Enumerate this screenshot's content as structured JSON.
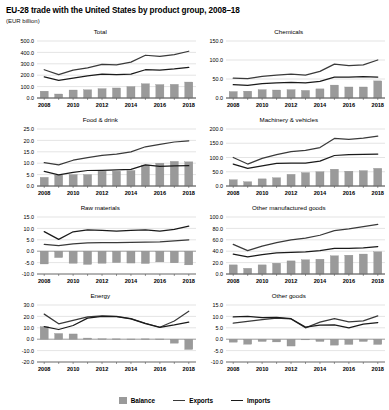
{
  "header": {
    "title": "EU-28 trade with the United States by product group, 2008–18",
    "subtitle": "(EUR billion)"
  },
  "legend": {
    "position": "bottom-center",
    "items": [
      {
        "label": "Balance",
        "marker": "bar-swatch",
        "color": "#9a9a9a"
      },
      {
        "label": "Exports",
        "marker": "line",
        "color": "#3a3a3a"
      },
      {
        "label": "Imports",
        "marker": "line",
        "color": "#1a1a1a"
      }
    ]
  },
  "chart_data": [
    {
      "type": "bar",
      "title": "Total",
      "xlabel": "",
      "ylabel": "",
      "grid": true,
      "x": [
        2008,
        2009,
        2010,
        2011,
        2012,
        2013,
        2014,
        2015,
        2016,
        2017,
        2018
      ],
      "tick_labels": [
        "2008",
        "",
        "2010",
        "",
        "2012",
        "",
        "2014",
        "",
        "2016",
        "",
        "2018"
      ],
      "ylim": [
        0,
        500
      ],
      "yticks": [
        0,
        100,
        200,
        300,
        400,
        500
      ],
      "ytick_labels": [
        "0.0",
        "100.0",
        "200.0",
        "300.0",
        "400.0",
        "500.0"
      ],
      "series": [
        {
          "name": "Balance",
          "type": "bar",
          "values": [
            60,
            35,
            70,
            72,
            82,
            88,
            100,
            125,
            118,
            120,
            140
          ]
        },
        {
          "name": "Exports",
          "type": "line",
          "values": [
            248,
            205,
            245,
            265,
            295,
            290,
            315,
            375,
            365,
            380,
            410
          ]
        },
        {
          "name": "Imports",
          "type": "line",
          "values": [
            185,
            155,
            175,
            195,
            210,
            205,
            210,
            248,
            245,
            255,
            268
          ]
        }
      ]
    },
    {
      "type": "bar",
      "title": "Chemicals",
      "xlabel": "",
      "ylabel": "",
      "grid": true,
      "x": [
        2008,
        2009,
        2010,
        2011,
        2012,
        2013,
        2014,
        2015,
        2016,
        2017,
        2018
      ],
      "tick_labels": [
        "2008",
        "",
        "2010",
        "",
        "2012",
        "",
        "2014",
        "",
        "2016",
        "",
        "2018"
      ],
      "ylim": [
        0,
        150
      ],
      "yticks": [
        0,
        50,
        100,
        150
      ],
      "ytick_labels": [
        "0.0",
        "50.0",
        "100.0",
        "150.0"
      ],
      "series": [
        {
          "name": "Balance",
          "type": "bar",
          "values": [
            17,
            18,
            22,
            21,
            22,
            20,
            24,
            34,
            29,
            29,
            45
          ]
        },
        {
          "name": "Exports",
          "type": "line",
          "values": [
            52,
            51,
            57,
            60,
            63,
            60,
            70,
            89,
            85,
            87,
            100
          ]
        },
        {
          "name": "Imports",
          "type": "line",
          "values": [
            35,
            33,
            38,
            40,
            41,
            40,
            44,
            55,
            55,
            56,
            55
          ]
        }
      ]
    },
    {
      "type": "bar",
      "title": "Food & drink",
      "xlabel": "",
      "ylabel": "",
      "grid": true,
      "x": [
        2008,
        2009,
        2010,
        2011,
        2012,
        2013,
        2014,
        2015,
        2016,
        2017,
        2018
      ],
      "tick_labels": [
        "2008",
        "",
        "2010",
        "",
        "2012",
        "",
        "2014",
        "",
        "2016",
        "",
        "2018"
      ],
      "ylim": [
        0,
        25
      ],
      "yticks": [
        0,
        5,
        10,
        15,
        20,
        25
      ],
      "ytick_labels": [
        "0.0",
        "5.0",
        "10.0",
        "15.0",
        "20.0",
        "25.0"
      ],
      "series": [
        {
          "name": "Balance",
          "type": "bar",
          "values": [
            3.8,
            4.8,
            5.0,
            5.0,
            6.5,
            6.5,
            6.8,
            9.2,
            10.0,
            10.8,
            10.6
          ]
        },
        {
          "name": "Exports",
          "type": "line",
          "values": [
            10.2,
            9.3,
            11.3,
            12.4,
            13.4,
            14.0,
            15.0,
            17.2,
            18.3,
            19.3,
            19.8
          ]
        },
        {
          "name": "Imports",
          "type": "line",
          "values": [
            6.4,
            4.9,
            6.0,
            6.8,
            6.9,
            7.1,
            7.3,
            9.3,
            8.6,
            8.8,
            8.9
          ]
        }
      ]
    },
    {
      "type": "bar",
      "title": "Machinery & vehicles",
      "xlabel": "",
      "ylabel": "",
      "grid": true,
      "x": [
        2008,
        2009,
        2010,
        2011,
        2012,
        2013,
        2014,
        2015,
        2016,
        2017,
        2018
      ],
      "tick_labels": [
        "2008",
        "",
        "2010",
        "",
        "2012",
        "",
        "2014",
        "",
        "2016",
        "",
        "2018"
      ],
      "ylim": [
        0,
        200
      ],
      "yticks": [
        0,
        50,
        100,
        150,
        200
      ],
      "ytick_labels": [
        "0.0",
        "50.0",
        "100.0",
        "150.0",
        "200.0"
      ],
      "series": [
        {
          "name": "Balance",
          "type": "bar",
          "values": [
            22,
            15,
            25,
            29,
            41,
            47,
            50,
            59,
            52,
            54,
            62
          ]
        },
        {
          "name": "Exports",
          "type": "line",
          "values": [
            100,
            77,
            97,
            110,
            121,
            125,
            135,
            167,
            164,
            168,
            175
          ]
        },
        {
          "name": "Imports",
          "type": "line",
          "values": [
            77,
            62,
            71,
            79,
            80,
            80,
            87,
            107,
            110,
            111,
            112
          ]
        }
      ]
    },
    {
      "type": "bar",
      "title": "Raw materials",
      "xlabel": "",
      "ylabel": "",
      "grid": true,
      "x": [
        2008,
        2009,
        2010,
        2011,
        2012,
        2013,
        2014,
        2015,
        2016,
        2017,
        2018
      ],
      "tick_labels": [
        "2008",
        "",
        "2010",
        "",
        "2012",
        "",
        "2014",
        "",
        "2016",
        "",
        "2018"
      ],
      "ylim": [
        -10,
        15
      ],
      "yticks": [
        -10,
        -5,
        0,
        5,
        10,
        15
      ],
      "ytick_labels": [
        "-10.0",
        "-5.0",
        "0.0",
        "5.0",
        "10.0",
        "15.0"
      ],
      "series": [
        {
          "name": "Balance",
          "type": "bar",
          "values": [
            -5.6,
            -2.8,
            -5.3,
            -5.8,
            -5.3,
            -5.0,
            -5.2,
            -5.4,
            -4.7,
            -5.1,
            -6.0
          ]
        },
        {
          "name": "Exports",
          "type": "line",
          "values": [
            3.0,
            2.4,
            3.2,
            3.6,
            3.8,
            3.8,
            3.9,
            4.0,
            4.1,
            4.5,
            5.0
          ]
        },
        {
          "name": "Imports",
          "type": "line",
          "values": [
            8.6,
            5.2,
            8.5,
            9.4,
            9.1,
            8.8,
            9.1,
            9.4,
            8.8,
            9.6,
            11.0
          ]
        }
      ]
    },
    {
      "type": "bar",
      "title": "Other manufactured goods",
      "xlabel": "",
      "ylabel": "",
      "grid": true,
      "x": [
        2008,
        2009,
        2010,
        2011,
        2012,
        2013,
        2014,
        2015,
        2016,
        2017,
        2018
      ],
      "tick_labels": [
        "2008",
        "",
        "2010",
        "",
        "2012",
        "",
        "2014",
        "",
        "2016",
        "",
        "2018"
      ],
      "ylim": [
        0,
        100
      ],
      "yticks": [
        0,
        20,
        40,
        60,
        80,
        100
      ],
      "ytick_labels": [
        "0.0",
        "20.0",
        "40.0",
        "60.0",
        "80.0",
        "100.0"
      ],
      "series": [
        {
          "name": "Balance",
          "type": "bar",
          "values": [
            16,
            10,
            16,
            19,
            23,
            25,
            26,
            32,
            33,
            35,
            39
          ]
        },
        {
          "name": "Exports",
          "type": "line",
          "values": [
            52,
            41,
            49,
            55,
            60,
            63,
            68,
            76,
            79,
            83,
            87
          ]
        },
        {
          "name": "Imports",
          "type": "line",
          "values": [
            35,
            30,
            34,
            37,
            38,
            39,
            41,
            45,
            45,
            46,
            48
          ]
        }
      ]
    },
    {
      "type": "bar",
      "title": "Energy",
      "xlabel": "",
      "ylabel": "",
      "grid": true,
      "x": [
        2008,
        2009,
        2010,
        2011,
        2012,
        2013,
        2014,
        2015,
        2016,
        2017,
        2018
      ],
      "tick_labels": [
        "2008",
        "",
        "2010",
        "",
        "2012",
        "",
        "2014",
        "",
        "2016",
        "",
        "2018"
      ],
      "ylim": [
        -20,
        30
      ],
      "yticks": [
        -20,
        -10,
        0,
        10,
        20,
        30
      ],
      "ytick_labels": [
        "-20.0",
        "-10.0",
        "0.0",
        "10.0",
        "20.0",
        "30.0"
      ],
      "series": [
        {
          "name": "Balance",
          "type": "bar",
          "values": [
            11.0,
            5.0,
            4.6,
            1.0,
            0.4,
            0.3,
            0.2,
            0.3,
            0.2,
            -3.5,
            -9.0
          ]
        },
        {
          "name": "Exports",
          "type": "line",
          "values": [
            22.0,
            13.5,
            16.5,
            19.5,
            20.5,
            20.0,
            18.0,
            14.0,
            10.5,
            16.0,
            24.5
          ]
        },
        {
          "name": "Imports",
          "type": "line",
          "values": [
            11.0,
            8.5,
            12.0,
            18.5,
            20.0,
            19.7,
            17.8,
            13.7,
            10.3,
            12.5,
            15.0
          ]
        }
      ]
    },
    {
      "type": "bar",
      "title": "Other goods",
      "xlabel": "",
      "ylabel": "",
      "grid": true,
      "x": [
        2008,
        2009,
        2010,
        2011,
        2012,
        2013,
        2014,
        2015,
        2016,
        2017,
        2018
      ],
      "tick_labels": [
        "2008",
        "",
        "2010",
        "",
        "2012",
        "",
        "2014",
        "",
        "2016",
        "",
        "2018"
      ],
      "ylim": [
        -10,
        15
      ],
      "yticks": [
        -10,
        -5,
        0,
        5,
        10,
        15
      ],
      "ytick_labels": [
        "-10.0",
        "-5.0",
        "0.0",
        "5.0",
        "10.0",
        "15.0"
      ],
      "series": [
        {
          "name": "Balance",
          "type": "bar",
          "values": [
            -1.3,
            -2.2,
            -1.0,
            -1.2,
            -3.0,
            -0.3,
            -1.0,
            -2.6,
            -2.3,
            -1.0,
            -2.3
          ]
        },
        {
          "name": "Exports",
          "type": "line",
          "values": [
            7.0,
            7.8,
            8.6,
            9.2,
            8.9,
            5.0,
            7.5,
            9.0,
            7.6,
            8.0,
            10.2
          ]
        },
        {
          "name": "Imports",
          "type": "line",
          "values": [
            9.8,
            10.0,
            9.5,
            9.6,
            9.0,
            5.3,
            6.2,
            6.3,
            5.0,
            6.6,
            7.3
          ]
        }
      ]
    }
  ]
}
